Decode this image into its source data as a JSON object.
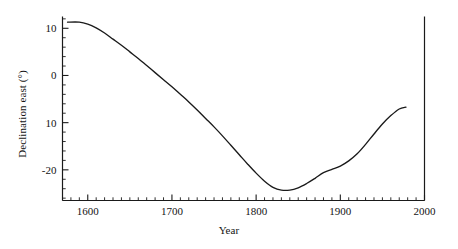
{
  "chart_data": {
    "type": "line",
    "title": "",
    "xlabel": "Year",
    "ylabel": "Declination east (°)",
    "xlim": [
      1570,
      2000
    ],
    "ylim": [
      -26.5,
      12.5
    ],
    "grid": false,
    "legend": "none",
    "x_ticks": [
      {
        "value": 1600,
        "label": "1600"
      },
      {
        "value": 1700,
        "label": "1700"
      },
      {
        "value": 1800,
        "label": "1800"
      },
      {
        "value": 1900,
        "label": "1900"
      },
      {
        "value": 2000,
        "label": "2000"
      }
    ],
    "x_minor_tick_step": 10,
    "y_ticks": [
      {
        "value": 10,
        "label": "10"
      },
      {
        "value": 0,
        "label": "0"
      },
      {
        "value": -10,
        "label": "10"
      },
      {
        "value": -20,
        "label": "-20"
      }
    ],
    "y_minor_tick_step": 2,
    "line_color": "#1a1a1a",
    "series": [
      {
        "name": "Declination east",
        "x": [
          1576,
          1590,
          1600,
          1610,
          1620,
          1630,
          1640,
          1650,
          1660,
          1670,
          1680,
          1690,
          1700,
          1710,
          1720,
          1730,
          1740,
          1750,
          1760,
          1770,
          1780,
          1790,
          1800,
          1810,
          1820,
          1830,
          1840,
          1850,
          1860,
          1870,
          1880,
          1890,
          1900,
          1910,
          1920,
          1930,
          1940,
          1950,
          1960,
          1970,
          1978
        ],
        "values": [
          11.3,
          11.3,
          10.9,
          10.1,
          9.0,
          7.7,
          6.4,
          5.0,
          3.6,
          2.1,
          0.6,
          -0.9,
          -2.4,
          -4.0,
          -5.6,
          -7.3,
          -9.1,
          -10.9,
          -12.8,
          -14.8,
          -16.8,
          -18.8,
          -20.7,
          -22.4,
          -23.7,
          -24.3,
          -24.3,
          -23.8,
          -22.9,
          -21.8,
          -20.6,
          -19.9,
          -19.2,
          -18.1,
          -16.6,
          -14.6,
          -12.4,
          -10.3,
          -8.5,
          -7.1,
          -6.7
        ]
      }
    ]
  }
}
